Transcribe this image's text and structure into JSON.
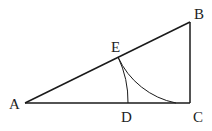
{
  "diagram": {
    "type": "geometry-figure",
    "points": {
      "A": {
        "label": "A",
        "x": 25,
        "y": 103
      },
      "B": {
        "label": "B",
        "x": 190,
        "y": 22
      },
      "C": {
        "label": "C",
        "x": 190,
        "y": 103
      },
      "D": {
        "label": "D",
        "x": 128,
        "y": 103
      },
      "E": {
        "label": "E",
        "x": 118,
        "y": 57
      }
    },
    "segments": [
      "AB",
      "BC",
      "AC"
    ],
    "arcs": [
      {
        "center": "A",
        "from": "E",
        "to": "D"
      },
      {
        "center": "B",
        "from": "E",
        "to": "C"
      }
    ],
    "colors": {
      "line": "#1a1a1a",
      "label": "#222222"
    }
  }
}
